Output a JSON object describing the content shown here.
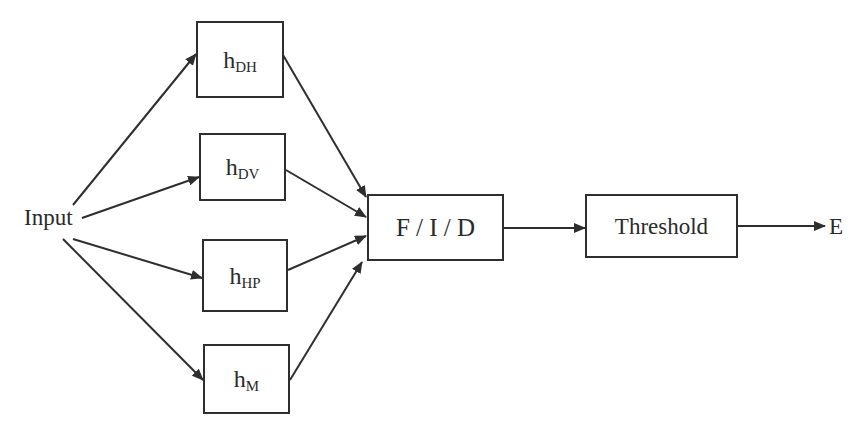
{
  "diagram": {
    "input_label": "Input",
    "output_label": "E",
    "filters": [
      {
        "base": "h",
        "sub": "DH"
      },
      {
        "base": "h",
        "sub": "DV"
      },
      {
        "base": "h",
        "sub": "HP"
      },
      {
        "base": "h",
        "sub": "M"
      }
    ],
    "fusion_label": "F / I / D",
    "threshold_label": "Threshold",
    "colors": {
      "line": "#2e2e2e",
      "background": "#ffffff"
    }
  }
}
